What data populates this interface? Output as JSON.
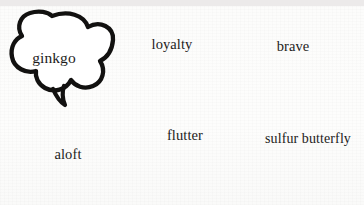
{
  "image": {
    "kind": "speech-bubble-illustration",
    "background_color": "#fcfcfb",
    "ink_color": "#111111",
    "width": 364,
    "height": 205
  },
  "bubbles": [
    {
      "id": "ginkgo",
      "label": "ginkgo",
      "shape": "cloud-scalloped",
      "tail": "v-shaped-tail-bottom",
      "position": "top-left"
    },
    {
      "id": "loyalty",
      "label": "loyalty",
      "shape": "rounded-blob",
      "tail": "angular-zigzag-tail-bottom",
      "position": "top-center"
    },
    {
      "id": "brave",
      "label": "brave",
      "shape": "pentagon",
      "tail": "lightning-bolt-tail-bottom-left",
      "position": "top-right"
    },
    {
      "id": "aloft",
      "label": "aloft",
      "shape": "stadium-rounded-rectangle",
      "tail": "thin-stem-tail-top",
      "position": "bottom-left"
    },
    {
      "id": "flutter",
      "label": "flutter",
      "shape": "cloud-four-lobe",
      "tail": "small-spike-tail-top",
      "position": "bottom-center"
    },
    {
      "id": "sulfur-butterfly",
      "label": "sulfur butterfly",
      "shape": "ellipse",
      "tail": "pointed-arrow-tail-left",
      "position": "bottom-right"
    }
  ],
  "decorations": [
    {
      "id": "corner-cloud-fragment",
      "description": "partial scalloped cloud cropped at bottom-left edge"
    }
  ]
}
